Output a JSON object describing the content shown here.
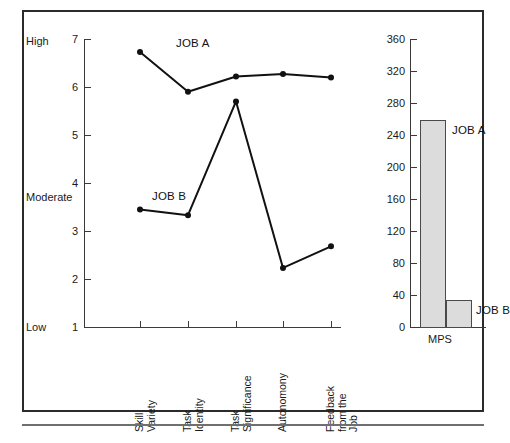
{
  "figure": {
    "title": "",
    "anchors": {
      "high": "High",
      "moderate": "Moderate",
      "low": "Low"
    }
  },
  "chart_data": [
    {
      "type": "line",
      "title": "",
      "xlabel": "",
      "ylabel": "",
      "ylim": [
        1,
        7
      ],
      "yticks": [
        "1",
        "2",
        "3",
        "4",
        "5",
        "6",
        "7"
      ],
      "grid": false,
      "legend_position": "inline-annotation",
      "annotations": [
        "High",
        "Moderate",
        "Low"
      ],
      "categories": [
        "Skill Variety",
        "Task Identity",
        "Task Significance",
        "Autonomony",
        "Feedback from the Job"
      ],
      "category_lines": [
        [
          "Skill",
          "Variety"
        ],
        [
          "Task",
          "Identity"
        ],
        [
          "Task",
          "Significance"
        ],
        [
          "Autonomony"
        ],
        [
          "Feedback",
          "from the",
          "Job"
        ]
      ],
      "series": [
        {
          "name": "JOB A",
          "values": [
            6.73,
            5.9,
            6.22,
            6.27,
            6.2
          ]
        },
        {
          "name": "JOB B",
          "values": [
            3.45,
            3.33,
            5.7,
            2.23,
            2.68
          ]
        }
      ]
    },
    {
      "type": "bar",
      "title": "",
      "xlabel": "MPS",
      "ylabel": "",
      "ylim": [
        0,
        360
      ],
      "yticks": [
        "0",
        "40",
        "80",
        "120",
        "160",
        "200",
        "240",
        "280",
        "320",
        "360"
      ],
      "grid": false,
      "legend_position": "inline-annotation",
      "categories": [
        "JOB A",
        "JOB B"
      ],
      "values": [
        259,
        35
      ]
    }
  ]
}
